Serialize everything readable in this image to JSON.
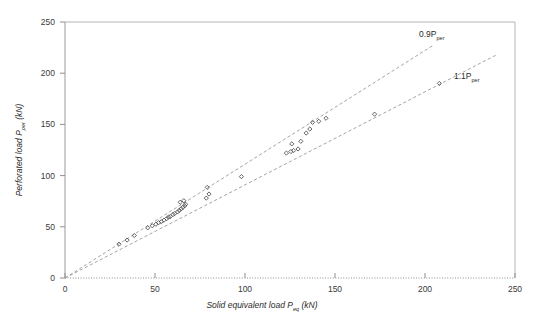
{
  "chart_data": {
    "type": "scatter",
    "title": "",
    "xlabel": "Solid equivalent load P eq (kN)",
    "xlabel_main": "Solid equivalent load P",
    "xlabel_sub": "eq",
    "xlabel_unit": "(kN)",
    "ylabel": "Perforated load P per (kN)",
    "ylabel_main": "Perforated load P",
    "ylabel_sub": "per",
    "ylabel_unit": "(kN)",
    "xlim": [
      0,
      250
    ],
    "ylim": [
      0,
      250
    ],
    "xticks": [
      0,
      50,
      100,
      150,
      200,
      250
    ],
    "yticks": [
      0,
      50,
      100,
      150,
      200,
      250
    ],
    "xtick_labels": [
      "0",
      "50",
      "100",
      "150",
      "200",
      "250"
    ],
    "ytick_labels": [
      "0",
      "50",
      "100",
      "150",
      "200",
      "250"
    ],
    "grid": false,
    "legend": "none",
    "marker_style": "open-diamond",
    "marker_color": "#4a4a4a",
    "reference_lines": [
      {
        "name": "upper-bound-line",
        "label_main": "0.9P",
        "label_sub": "per",
        "label": "0.9P per",
        "slope": 1.1111,
        "intercept": 0,
        "style": "dashed",
        "color": "#9a9a9a",
        "x_start": 0,
        "x_end": 205,
        "label_x": 202,
        "label_y": 227
      },
      {
        "name": "lower-bound-line",
        "label_main": "1.1P",
        "label_sub": "per",
        "label": "1.1P per",
        "slope": 0.9091,
        "intercept": 0,
        "style": "dashed",
        "color": "#9a9a9a",
        "x_start": 0,
        "x_end": 240,
        "label_x": 222,
        "label_y": 197
      }
    ],
    "series": [
      {
        "name": "Perforated vs solid equivalent load",
        "points": [
          [
            30.0,
            33.0
          ],
          [
            34.5,
            37.0
          ],
          [
            38.5,
            41.5
          ],
          [
            46.0,
            49.0
          ],
          [
            48.5,
            51.0
          ],
          [
            50.5,
            52.5
          ],
          [
            52.0,
            54.0
          ],
          [
            53.5,
            55.0
          ],
          [
            55.0,
            56.5
          ],
          [
            56.5,
            58.0
          ],
          [
            57.5,
            59.5
          ],
          [
            58.5,
            60.0
          ],
          [
            60.0,
            62.0
          ],
          [
            61.0,
            63.0
          ],
          [
            62.5,
            64.5
          ],
          [
            63.5,
            66.0
          ],
          [
            64.5,
            67.5
          ],
          [
            65.5,
            69.0
          ],
          [
            66.5,
            70.5
          ],
          [
            64.0,
            74.0
          ],
          [
            66.0,
            75.5
          ],
          [
            67.0,
            72.0
          ],
          [
            78.5,
            78.0
          ],
          [
            80.0,
            82.0
          ],
          [
            79.0,
            88.5
          ],
          [
            98.0,
            99.0
          ],
          [
            123.0,
            122.0
          ],
          [
            125.5,
            123.5
          ],
          [
            127.0,
            124.5
          ],
          [
            126.0,
            131.0
          ],
          [
            129.5,
            126.0
          ],
          [
            131.0,
            133.5
          ],
          [
            134.0,
            141.5
          ],
          [
            136.0,
            145.5
          ],
          [
            137.5,
            152.0
          ],
          [
            141.0,
            153.0
          ],
          [
            145.0,
            156.0
          ],
          [
            172.0,
            160.0
          ],
          [
            208.0,
            190.0
          ]
        ]
      }
    ]
  },
  "axes": {
    "plot_left_px": 65,
    "plot_right_px": 515,
    "plot_top_px": 22,
    "plot_bottom_px": 278
  }
}
